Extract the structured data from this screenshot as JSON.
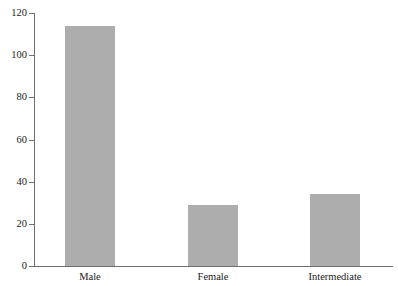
{
  "chart_data": {
    "type": "bar",
    "title": "",
    "subtitle": "",
    "xlabel": "",
    "ylabel": "",
    "categories": [
      "Male",
      "Female",
      "Intermediate"
    ],
    "values": [
      114,
      29,
      34
    ],
    "series": [
      {
        "name": "Count",
        "values": [
          114,
          29,
          34
        ]
      }
    ],
    "ylim": [
      0,
      120
    ],
    "yticks": [
      0,
      20,
      40,
      60,
      80,
      100,
      120
    ],
    "ytick_labels": [
      "0",
      "20",
      "40",
      "60",
      "80",
      "100",
      "120"
    ],
    "grid": true,
    "grid_axis": "y",
    "legend": false,
    "legend_position": "none",
    "bar_color": "#adadad",
    "axis_color": "#6e6e6e",
    "background_color": "#ffffff"
  }
}
